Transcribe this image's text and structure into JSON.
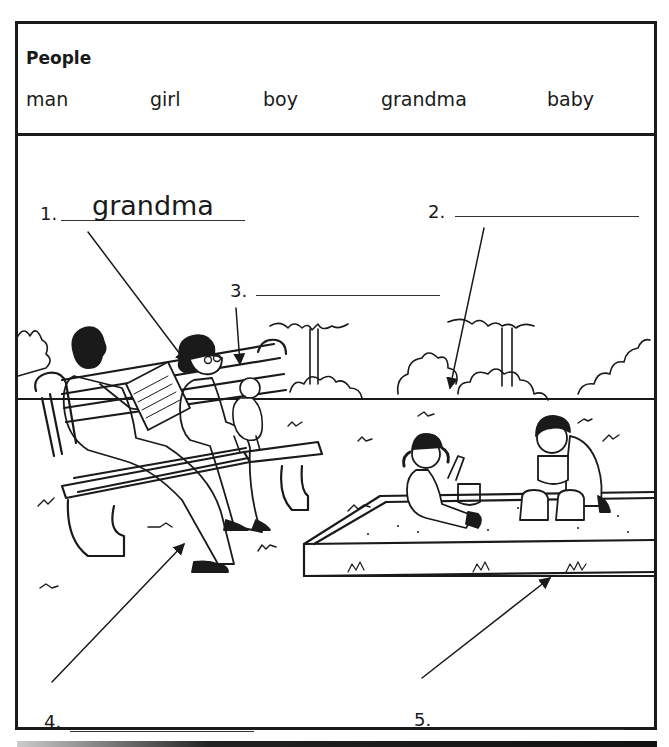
{
  "worksheet": {
    "word_bank": {
      "title": "People",
      "words": [
        "man",
        "girl",
        "boy",
        "grandma",
        "baby"
      ]
    },
    "questions": [
      {
        "number": "1.",
        "answer": "grandma",
        "target": "grandma"
      },
      {
        "number": "2.",
        "answer": "",
        "target": "trees / bushes"
      },
      {
        "number": "3.",
        "answer": "",
        "target": "bench"
      },
      {
        "number": "4.",
        "answer": "",
        "target": "man"
      },
      {
        "number": "5.",
        "answer": "",
        "target": "sandbox"
      }
    ],
    "illustration": {
      "description": "Park scene: a man reading a newspaper and a grandma holding a baby on a bench; a girl and a boy playing in a sandbox; trees and bushes in the background"
    }
  }
}
